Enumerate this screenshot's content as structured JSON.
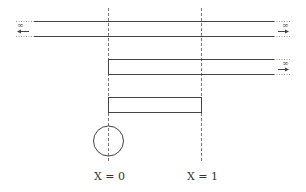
{
  "diagram": {
    "labels": {
      "x0": "X = 0",
      "x1": "X = 1",
      "infinity": "∞"
    },
    "colors": {
      "line": "#444444",
      "dashed": "#777777",
      "dotted": "#999999"
    }
  }
}
